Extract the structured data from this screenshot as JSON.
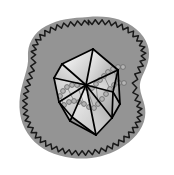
{
  "figure": {
    "title": "Enveloped icosahedral virus particle",
    "width": 174,
    "height": 175,
    "background_color": "#ffffff"
  },
  "colors": {
    "envelope_fill": "#949494",
    "envelope_outline": "#1a1a1a",
    "capsid_edge": "#000000",
    "capsid_face_light": "#ffffff",
    "capsid_face_mid": "#d8d8d8",
    "capsid_face_dark": "#8f8f8f",
    "dna_bead_stroke": "#6f6f6f",
    "dna_bead_fill": "#b4b4b4"
  },
  "parts": [
    {
      "id": "envelope",
      "label": "viral envelope",
      "description": "irregular rounded gray blob with spiky wavy outer membrane"
    },
    {
      "id": "capsid",
      "label": "icosahedral capsid",
      "description": "20-faced polyhedron with shaded triangular facets"
    },
    {
      "id": "genome",
      "label": "nucleic acid genome",
      "description": "beaded helical strand coiled inside the capsid"
    }
  ],
  "geometry": {
    "envelope_blob_path": "M 88 17 C 108 15 124 19 136 29 C 148 39 151 51 148 62 C 145 73 139 79 140 88 C 141 98 147 105 145 117 C 143 130 133 141 119 149 C 105 157 88 160 72 158 C 55 156 40 149 31 138 C 21 126 18 111 20 96 C 22 81 29 68 28 57 C 27 45 33 33 46 26 C 59 19 72 18 88 17 Z",
    "envelope_wave": {
      "amplitude": 4.6,
      "wavelength": 7.2,
      "offset": 3.2,
      "stroke_width": 1.5
    },
    "capsid_vertices": {
      "top": [
        93,
        49
      ],
      "upper_left": [
        62,
        64
      ],
      "upper_right": [
        118,
        70
      ],
      "mid_left": [
        54,
        78
      ],
      "mid_center": [
        86,
        85
      ],
      "mid_right": [
        113,
        92
      ],
      "lower_left": [
        59,
        102
      ],
      "lower_center_left": [
        72,
        117
      ],
      "lower_right": [
        120,
        104
      ],
      "bottom_left": [
        70,
        121
      ],
      "bottom": [
        96,
        135
      ],
      "bottom_right": [
        112,
        118
      ]
    },
    "capsid_faces": [
      {
        "id": "f1",
        "points": "93,49 62,64 86,85",
        "g": "gA"
      },
      {
        "id": "f2",
        "points": "93,49 86,85 118,70",
        "g": "gB"
      },
      {
        "id": "f3",
        "points": "62,64 54,78 86,85",
        "g": "gC"
      },
      {
        "id": "f4",
        "points": "54,78 59,102 86,85",
        "g": "gD"
      },
      {
        "id": "f5",
        "points": "86,85 59,102 72,117",
        "g": "gE"
      },
      {
        "id": "f6",
        "points": "86,85 72,117 96,135",
        "g": "gF"
      },
      {
        "id": "f7",
        "points": "86,85 96,135 112,118",
        "g": "gG"
      },
      {
        "id": "f8",
        "points": "86,85 112,118 113,92",
        "g": "gH"
      },
      {
        "id": "f9",
        "points": "86,85 113,92 118,70",
        "g": "gI"
      },
      {
        "id": "f10",
        "points": "118,70 113,92 120,104",
        "g": "gJ"
      },
      {
        "id": "f11",
        "points": "113,92 120,104 112,118",
        "g": "gK"
      },
      {
        "id": "f12",
        "points": "59,102 70,121 72,117",
        "g": "gL"
      }
    ],
    "capsid_edges": [
      "93,49 62,64",
      "62,64 54,78",
      "54,78 59,102",
      "59,102 70,121",
      "70,121 96,135",
      "96,135 112,118",
      "112,118 120,104",
      "120,104 118,70",
      "118,70 93,49",
      "93,49 86,85",
      "62,64 86,85",
      "54,78 86,85",
      "59,102 86,85",
      "72,117 86,85",
      "96,135 86,85",
      "112,118 86,85",
      "113,92 86,85",
      "118,70 86,85",
      "113,92 118,70",
      "113,92 120,104",
      "113,92 112,118",
      "59,102 72,117",
      "72,117 96,135",
      "72,117 70,121"
    ],
    "dna_strand": {
      "bead_radius": 2.4,
      "bead_count": 44,
      "path_a": "M 60 96 C 64 86 74 83 84 86 C 95 89 100 81 107 74 C 112 69 118 66 124 67",
      "path_b": "M 64 104 C 70 99 78 100 86 104 C 95 109 101 104 108 95 C 113 89 118 84 124 83",
      "beads_a": [
        [
          60,
          96
        ],
        [
          63,
          91
        ],
        [
          67,
          87
        ],
        [
          72,
          85
        ],
        [
          77,
          85
        ],
        [
          82,
          86
        ],
        [
          87,
          88
        ],
        [
          92,
          88
        ],
        [
          96,
          84
        ],
        [
          100,
          80
        ],
        [
          104,
          76
        ],
        [
          108,
          72
        ],
        [
          113,
          69
        ],
        [
          118,
          67
        ],
        [
          123,
          67
        ]
      ],
      "beads_b": [
        [
          64,
          105
        ],
        [
          69,
          102
        ],
        [
          74,
          101
        ],
        [
          79,
          102
        ],
        [
          84,
          104
        ],
        [
          89,
          107
        ],
        [
          94,
          108
        ],
        [
          98,
          104
        ],
        [
          102,
          99
        ],
        [
          106,
          94
        ],
        [
          110,
          89
        ],
        [
          114,
          85
        ],
        [
          119,
          83
        ],
        [
          124,
          83
        ]
      ],
      "rungs": [
        [
          [
            60,
            96
          ],
          [
            64,
            105
          ]
        ],
        [
          [
            67,
            87
          ],
          [
            74,
            101
          ]
        ],
        [
          [
            77,
            85
          ],
          [
            84,
            104
          ]
        ],
        [
          [
            87,
            88
          ],
          [
            94,
            108
          ]
        ],
        [
          [
            96,
            84
          ],
          [
            98,
            104
          ]
        ],
        [
          [
            104,
            76
          ],
          [
            110,
            89
          ]
        ],
        [
          [
            113,
            69
          ],
          [
            119,
            83
          ]
        ]
      ]
    }
  }
}
